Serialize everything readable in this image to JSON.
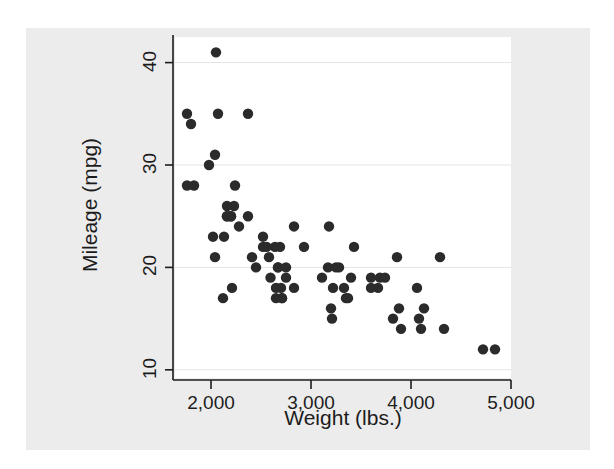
{
  "figure": {
    "background_color": "#ffffff",
    "panel_color": "#ececec",
    "plot_background_color": "#ffffff",
    "axis_color": "#1c1c1c",
    "grid_color": "#e3e3e3",
    "marker_color": "#2b2b2b"
  },
  "chart_data": {
    "type": "scatter",
    "title": "",
    "xlabel": "Weight (lbs.)",
    "ylabel": "Mileage (mpg)",
    "xlim": [
      1640,
      5000
    ],
    "ylim": [
      9.2,
      42.5
    ],
    "xticks": [
      2000,
      3000,
      4000,
      5000
    ],
    "xtick_labels": [
      "2,000",
      "3,000",
      "4,000",
      "5,000"
    ],
    "yticks": [
      10,
      20,
      30,
      40
    ],
    "ytick_labels": [
      "10",
      "20",
      "30",
      "40"
    ],
    "grid": "horizontal",
    "legend": "none",
    "marker": "solid-circle",
    "n_points": 74,
    "series": [
      {
        "name": "Mileage vs Weight",
        "x": [
          2930,
          3350,
          2640,
          3250,
          4080,
          3670,
          2230,
          3280,
          3880,
          3400,
          4330,
          3900,
          4290,
          4100,
          3860,
          3110,
          3690,
          3180,
          3220,
          4060,
          3600,
          3600,
          3740,
          4840,
          4720,
          3370,
          4130,
          3820,
          2690,
          3430,
          3210,
          2580,
          2200,
          2520,
          3330,
          2830,
          2200,
          2670,
          2595,
          2700,
          2556,
          2370,
          2020,
          2280,
          2750,
          3170,
          2710,
          2450,
          3200,
          2710,
          2120,
          2160,
          2040,
          2670,
          2210,
          2750,
          2130,
          2650,
          1760,
          2240,
          2650,
          1800,
          1760,
          2050,
          2410,
          2520,
          1980,
          1830,
          2160,
          2040,
          2070,
          2160,
          2370,
          2830
        ],
        "y": [
          22,
          17,
          22,
          20,
          15,
          18,
          26,
          20,
          16,
          19,
          14,
          14,
          21,
          14,
          21,
          19,
          19,
          24,
          18,
          18,
          18,
          19,
          19,
          12,
          12,
          17,
          16,
          15,
          22,
          22,
          15,
          21,
          25,
          22,
          18,
          18,
          25,
          20,
          19,
          18,
          22,
          25,
          23,
          24,
          19,
          20,
          17,
          20,
          16,
          17,
          17,
          25,
          21,
          20,
          18,
          20,
          23,
          18,
          28,
          28,
          17,
          34,
          35,
          41,
          21,
          23,
          30,
          28,
          25,
          31,
          35,
          26,
          35,
          24
        ]
      }
    ]
  }
}
